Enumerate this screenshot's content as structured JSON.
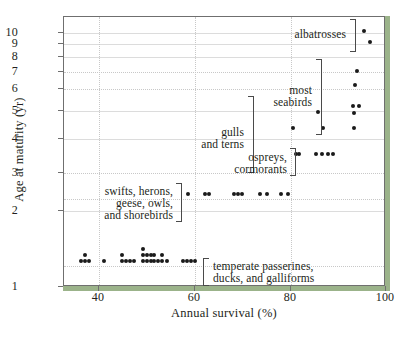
{
  "chart": {
    "type": "scatter",
    "title": "",
    "xlabel": "Annual survival (%)",
    "ylabel": "Age at maturity (yr)",
    "xlim": [
      33,
      101
    ],
    "ylim": [
      1,
      10.6
    ],
    "yscale": "log",
    "xticks": [
      "40",
      "60",
      "80",
      "100"
    ],
    "yticks": [
      "1",
      "2",
      "3",
      "4",
      "5",
      "6",
      "7",
      "8",
      "9",
      "10"
    ],
    "grid": "dotted horizontal and vertical at ticks",
    "legend": "none (inline group annotations with brackets)",
    "colors": {
      "point": "#1a1a1a",
      "frame": "#6f6f6f",
      "grid": "#c8c8c8",
      "accent": "#9bb38a",
      "text": "#231f20"
    }
  },
  "chart_data": {
    "type": "scatter",
    "title": "",
    "xlabel": "Annual survival (%)",
    "ylabel": "Age at maturity (yr)",
    "xlim": [
      33,
      101
    ],
    "ylim": [
      1,
      10.6
    ],
    "yscale": "log",
    "xticks": [
      40,
      60,
      80,
      100
    ],
    "yticks": [
      1,
      2,
      3,
      4,
      5,
      6,
      7,
      8,
      9,
      10
    ],
    "grid": true,
    "legend_position": "inline-annotations",
    "series": [
      {
        "name": "temperate passerines, ducks, and galliforms",
        "points": [
          [
            36.5,
            1.25
          ],
          [
            37.3,
            1.25
          ],
          [
            37.3,
            1.32
          ],
          [
            38.1,
            1.25
          ],
          [
            41.2,
            1.25
          ],
          [
            45.0,
            1.25
          ],
          [
            45.0,
            1.32
          ],
          [
            45.8,
            1.25
          ],
          [
            46.6,
            1.25
          ],
          [
            47.6,
            1.25
          ],
          [
            49.4,
            1.25
          ],
          [
            49.4,
            1.32
          ],
          [
            49.4,
            1.4
          ],
          [
            50.2,
            1.25
          ],
          [
            50.2,
            1.32
          ],
          [
            51.0,
            1.25
          ],
          [
            51.0,
            1.32
          ],
          [
            51.8,
            1.25
          ],
          [
            51.8,
            1.32
          ],
          [
            52.6,
            1.25
          ],
          [
            53.4,
            1.25
          ],
          [
            53.4,
            1.32
          ],
          [
            54.5,
            1.25
          ],
          [
            57.8,
            1.25
          ],
          [
            58.6,
            1.25
          ],
          [
            59.4,
            1.25
          ],
          [
            60.2,
            1.25
          ]
        ]
      },
      {
        "name": "swifts, herons, geese, owls, and shorebirds",
        "points": [
          [
            58.9,
            2.3
          ],
          [
            62.3,
            2.3
          ],
          [
            63.1,
            2.3
          ],
          [
            68.5,
            2.3
          ],
          [
            69.3,
            2.3
          ],
          [
            70.1,
            2.3
          ],
          [
            73.8,
            2.3
          ],
          [
            75.4,
            2.3
          ],
          [
            78.3,
            2.3
          ],
          [
            79.8,
            2.3
          ]
        ]
      },
      {
        "name": "ospreys, cormorants",
        "points": [
          [
            81.3,
            3.3
          ],
          [
            82.1,
            3.3
          ],
          [
            85.5,
            3.3
          ],
          [
            86.9,
            3.3
          ],
          [
            88.0,
            3.3
          ],
          [
            89.1,
            3.3
          ]
        ]
      },
      {
        "name": "most seabirds",
        "points": [
          [
            80.8,
            4.2
          ],
          [
            87.0,
            4.2
          ],
          [
            93.5,
            4.2
          ],
          [
            86.0,
            4.85
          ],
          [
            93.5,
            4.8
          ],
          [
            93.4,
            5.1
          ],
          [
            94.6,
            5.1
          ],
          [
            93.8,
            6.2
          ],
          [
            94.2,
            7.0
          ]
        ]
      },
      {
        "name": "albatrosses",
        "points": [
          [
            95.5,
            10.1
          ],
          [
            96.8,
            9.1
          ]
        ]
      }
    ],
    "annotations": [
      {
        "text": "albatrosses",
        "group": "albatrosses"
      },
      {
        "text": "most seabirds",
        "group": "most seabirds"
      },
      {
        "text": "gulls and terns",
        "group": "gulls and terns"
      },
      {
        "text": "ospreys, cormorants",
        "group": "ospreys, cormorants"
      },
      {
        "text": "swifts, herons, geese, owls, and shorebirds",
        "group": "swifts, herons, geese, owls, and shorebirds"
      },
      {
        "text": "temperate passerines, ducks, and galliforms",
        "group": "temperate passerines, ducks, and galliforms"
      }
    ]
  },
  "labels": {
    "albatrosses": "albatrosses",
    "seabirds_line1": "most",
    "seabirds_line2": "seabirds",
    "gulls_line1": "gulls",
    "gulls_line2": "and terns",
    "ospreys_line1": "ospreys,",
    "ospreys_line2": "cormorants",
    "swifts_line1": "swifts, herons,",
    "swifts_line2": "geese, owls,",
    "swifts_line3": "and shorebirds",
    "temperate_line1": "temperate passerines,",
    "temperate_line2": "ducks, and galliforms"
  }
}
